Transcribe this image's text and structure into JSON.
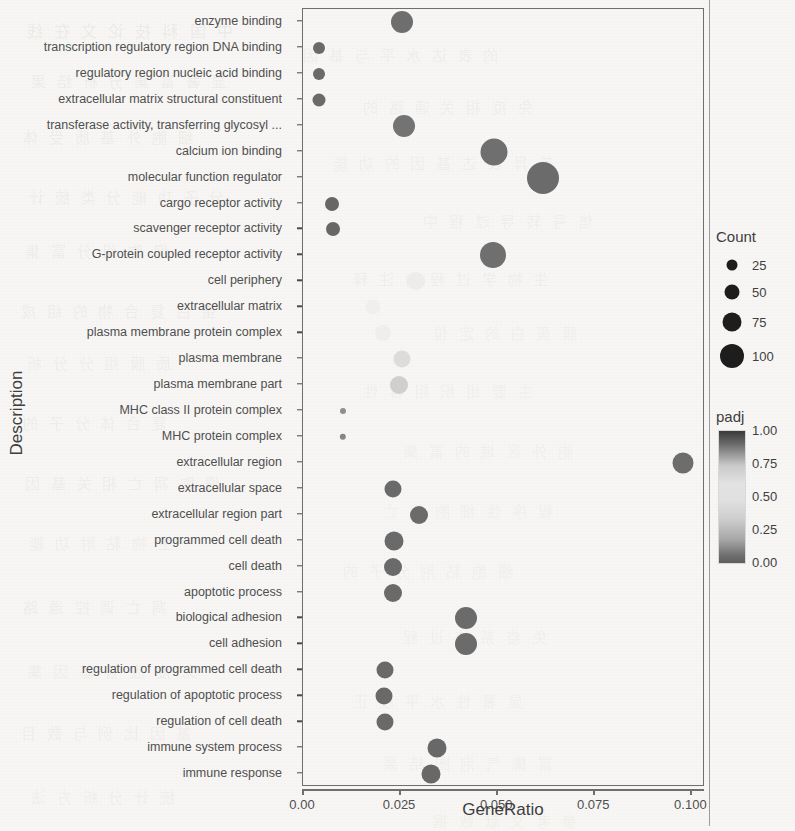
{
  "axes": {
    "y_title": "Description",
    "x_title": "GeneRatio",
    "x_ticks": [
      "0.00",
      "0.025",
      "0.050",
      "0.075",
      "0.100"
    ],
    "x_tick_values": [
      0.0,
      0.025,
      0.05,
      0.075,
      0.1
    ]
  },
  "legend": {
    "count_title": "Count",
    "count_labels": [
      "25",
      "50",
      "75",
      "100"
    ],
    "count_values": [
      25,
      50,
      75,
      100
    ],
    "padj_title": "padj",
    "padj_ticks": [
      "1.00",
      "0.75",
      "0.50",
      "0.25",
      "0.00"
    ],
    "padj_tick_values": [
      1.0,
      0.75,
      0.5,
      0.25,
      0.0
    ],
    "colorbar_low_color": "#5d5d5d",
    "colorbar_mid_color": "#e0e0e0",
    "colorbar_high_color": "#3a3a3a"
  },
  "chart_data": {
    "type": "scatter",
    "title": "",
    "xlabel": "GeneRatio",
    "ylabel": "Description",
    "xlim": [
      0.0,
      0.1035
    ],
    "grid": false,
    "legend_position": "right",
    "size_legend": {
      "name": "Count",
      "breaks": [
        25,
        50,
        75,
        100
      ]
    },
    "color_legend": {
      "name": "padj",
      "breaks": [
        0.0,
        0.25,
        0.5,
        0.75,
        1.0
      ]
    },
    "categories": [
      "enzyme binding",
      "transcription regulatory region DNA binding",
      "regulatory region nucleic acid binding",
      "extracellular matrix structural constituent",
      "transferase activity, transferring glycosyl ...",
      "calcium ion binding",
      "molecular function regulator",
      "cargo receptor activity",
      "scavenger receptor activity",
      "G-protein coupled receptor activity",
      "cell periphery",
      "extracellular matrix",
      "plasma membrane protein complex",
      "plasma membrane",
      "plasma membrane part",
      "MHC class II protein complex",
      "MHC protein complex",
      "extracellular region",
      "extracellular space",
      "extracellular region part",
      "programmed cell death",
      "cell death",
      "apoptotic process",
      "biological adhesion",
      "cell adhesion",
      "regulation of programmed cell death",
      "regulation of apoptotic process",
      "regulation of cell death",
      "immune system process",
      "immune response"
    ],
    "points": [
      {
        "description": "enzyme binding",
        "gene_ratio": 0.0255,
        "count": 62,
        "padj": 0.46,
        "radius": 11.0,
        "color": "#6e6e6e"
      },
      {
        "description": "transcription regulatory region DNA binding",
        "gene_ratio": 0.004,
        "count": 18,
        "padj": 0.3,
        "radius": 6.0,
        "color": "#6a6a6a"
      },
      {
        "description": "regulatory region nucleic acid binding",
        "gene_ratio": 0.004,
        "count": 18,
        "padj": 0.3,
        "radius": 6.0,
        "color": "#6a6a6a"
      },
      {
        "description": "extracellular matrix structural constituent",
        "gene_ratio": 0.004,
        "count": 18,
        "padj": 0.26,
        "radius": 6.5,
        "color": "#6a6a6a"
      },
      {
        "description": "transferase activity, transferring glycosyl ...",
        "gene_ratio": 0.026,
        "count": 62,
        "padj": 0.52,
        "radius": 11.0,
        "color": "#737373"
      },
      {
        "description": "calcium ion binding",
        "gene_ratio": 0.0492,
        "count": 90,
        "padj": 0.6,
        "radius": 13.5,
        "color": "#6f6f6f"
      },
      {
        "description": "molecular function regulator",
        "gene_ratio": 0.0617,
        "count": 105,
        "padj": 0.7,
        "radius": 16.0,
        "color": "#6b6b6b"
      },
      {
        "description": "cargo receptor activity",
        "gene_ratio": 0.0075,
        "count": 22,
        "padj": 0.22,
        "radius": 7.0,
        "color": "#676767"
      },
      {
        "description": "scavenger receptor activity",
        "gene_ratio": 0.0078,
        "count": 22,
        "padj": 0.22,
        "radius": 7.0,
        "color": "#676767"
      },
      {
        "description": "G-protein coupled receptor activity",
        "gene_ratio": 0.049,
        "count": 88,
        "padj": 0.55,
        "radius": 13.0,
        "color": "#6f6f6f"
      },
      {
        "description": "cell periphery",
        "gene_ratio": 0.029,
        "count": 48,
        "padj": 0.97,
        "radius": 9.0,
        "color": "#ececec"
      },
      {
        "description": "extracellular matrix",
        "gene_ratio": 0.018,
        "count": 34,
        "padj": 0.96,
        "radius": 7.5,
        "color": "#efefef"
      },
      {
        "description": "plasma membrane protein complex",
        "gene_ratio": 0.0205,
        "count": 38,
        "padj": 0.95,
        "radius": 8.0,
        "color": "#eeeeee"
      },
      {
        "description": "plasma membrane",
        "gene_ratio": 0.0255,
        "count": 44,
        "padj": 0.9,
        "radius": 8.5,
        "color": "#dcdcdc"
      },
      {
        "description": "plasma membrane part",
        "gene_ratio": 0.0248,
        "count": 44,
        "padj": 0.86,
        "radius": 9.0,
        "color": "#cfcfcf"
      },
      {
        "description": "MHC class II protein complex",
        "gene_ratio": 0.0102,
        "count": 8,
        "padj": 0.18,
        "radius": 3.0,
        "color": "#8e8e8e"
      },
      {
        "description": "MHC protein complex",
        "gene_ratio": 0.0102,
        "count": 9,
        "padj": 0.18,
        "radius": 3.2,
        "color": "#868686"
      },
      {
        "description": "extracellular region",
        "gene_ratio": 0.0978,
        "count": 95,
        "padj": 0.62,
        "radius": 10.5,
        "color": "#6d6d6d"
      },
      {
        "description": "extracellular space",
        "gene_ratio": 0.0232,
        "count": 42,
        "padj": 0.4,
        "radius": 8.5,
        "color": "#6a6a6a"
      },
      {
        "description": "extracellular region part",
        "gene_ratio": 0.0298,
        "count": 50,
        "padj": 0.42,
        "radius": 9.0,
        "color": "#6b6b6b"
      },
      {
        "description": "programmed cell death",
        "gene_ratio": 0.0235,
        "count": 46,
        "padj": 0.35,
        "radius": 9.5,
        "color": "#6a6a6a"
      },
      {
        "description": "cell death",
        "gene_ratio": 0.0232,
        "count": 44,
        "padj": 0.35,
        "radius": 9.0,
        "color": "#6a6a6a"
      },
      {
        "description": "apoptotic process",
        "gene_ratio": 0.0232,
        "count": 44,
        "padj": 0.35,
        "radius": 9.0,
        "color": "#6a6a6a"
      },
      {
        "description": "biological adhesion",
        "gene_ratio": 0.042,
        "count": 68,
        "padj": 0.38,
        "radius": 11.0,
        "color": "#6b6b6b"
      },
      {
        "description": "cell adhesion",
        "gene_ratio": 0.042,
        "count": 68,
        "padj": 0.38,
        "radius": 11.0,
        "color": "#6b6b6b"
      },
      {
        "description": "regulation of programmed cell death",
        "gene_ratio": 0.021,
        "count": 40,
        "padj": 0.3,
        "radius": 8.5,
        "color": "#696969"
      },
      {
        "description": "regulation of apoptotic process",
        "gene_ratio": 0.0208,
        "count": 40,
        "padj": 0.3,
        "radius": 8.5,
        "color": "#696969"
      },
      {
        "description": "regulation of cell death",
        "gene_ratio": 0.021,
        "count": 40,
        "padj": 0.3,
        "radius": 8.5,
        "color": "#696969"
      },
      {
        "description": "immune system process",
        "gene_ratio": 0.0345,
        "count": 56,
        "padj": 0.2,
        "radius": 9.5,
        "color": "#686868"
      },
      {
        "description": "immune response",
        "gene_ratio": 0.033,
        "count": 54,
        "padj": 0.2,
        "radius": 9.5,
        "color": "#686868"
      }
    ]
  },
  "texture_blots": [
    {
      "t": "中 国 科 技 论 文 在 线",
      "x": 24,
      "y": 18,
      "s": 16,
      "o": 0.3
    },
    {
      "t": "的 表 达 水 平 与 基 因",
      "x": 300,
      "y": 44,
      "s": 15,
      "o": 0.22
    },
    {
      "t": "显 著 富 集 分 析 结 果",
      "x": 28,
      "y": 70,
      "s": 15,
      "o": 0.26
    },
    {
      "t": "免 疫 相 关 通 路 的",
      "x": 360,
      "y": 96,
      "s": 15,
      "o": 0.2
    },
    {
      "t": "细 胞 外 基 质 受 体",
      "x": 20,
      "y": 126,
      "s": 15,
      "o": 0.26
    },
    {
      "t": "差 异 表 达 基 因 的 功 能",
      "x": 330,
      "y": 152,
      "s": 15,
      "o": 0.2
    },
    {
      "t": "分 子 功 能 分 类 统 计",
      "x": 26,
      "y": 186,
      "s": 15,
      "o": 0.24
    },
    {
      "t": "信 号 转 导 过 程 中",
      "x": 420,
      "y": 210,
      "s": 15,
      "o": 0.2
    },
    {
      "t": "细 胞 组 分 富 集",
      "x": 22,
      "y": 240,
      "s": 15,
      "o": 0.24
    },
    {
      "t": "生 物 学 过 程 的 注 释",
      "x": 350,
      "y": 268,
      "s": 15,
      "o": 0.2
    },
    {
      "t": "蛋 白 复 合 物 的 组 成",
      "x": 18,
      "y": 300,
      "s": 15,
      "o": 0.24
    },
    {
      "t": "膜 蛋 白 的 定 位",
      "x": 430,
      "y": 322,
      "s": 15,
      "o": 0.18
    },
    {
      "t": "质 膜 组 分 分 析",
      "x": 24,
      "y": 352,
      "s": 15,
      "o": 0.22
    },
    {
      "t": "主 要 组 织 相 容 性",
      "x": 360,
      "y": 380,
      "s": 15,
      "o": 0.18
    },
    {
      "t": "复 合 体 分 子 的",
      "x": 20,
      "y": 412,
      "s": 15,
      "o": 0.22
    },
    {
      "t": "胞 外 区 域 的 富 集",
      "x": 400,
      "y": 440,
      "s": 15,
      "o": 0.18
    },
    {
      "t": "细 胞 凋 亡 相 关 基 因",
      "x": 22,
      "y": 472,
      "s": 15,
      "o": 0.24
    },
    {
      "t": "程 序 性 细 胞 死 亡",
      "x": 380,
      "y": 500,
      "s": 15,
      "o": 0.18
    },
    {
      "t": "生 物 粘 附 功 能",
      "x": 26,
      "y": 532,
      "s": 15,
      "o": 0.22
    },
    {
      "t": "细 胞 粘 附 分 子 的",
      "x": 340,
      "y": 560,
      "s": 15,
      "o": 0.18
    },
    {
      "t": "凋 亡 调 控 通 路",
      "x": 20,
      "y": 596,
      "s": 15,
      "o": 0.24
    },
    {
      "t": "免 疫 系 统 过 程",
      "x": 400,
      "y": 626,
      "s": 15,
      "o": 0.18
    },
    {
      "t": "免 疫 应 答 基 因 集",
      "x": 24,
      "y": 660,
      "s": 15,
      "o": 0.22
    },
    {
      "t": "显 著 性 水 平 校 正",
      "x": 350,
      "y": 690,
      "s": 15,
      "o": 0.18
    },
    {
      "t": "基 因 比 例 与 数 目",
      "x": 18,
      "y": 722,
      "s": 15,
      "o": 0.22
    },
    {
      "t": "富 集 气 泡 图 结 果",
      "x": 380,
      "y": 752,
      "s": 15,
      "o": 0.18
    },
    {
      "t": "统 计 分 析 方 法",
      "x": 28,
      "y": 786,
      "s": 15,
      "o": 0.2
    },
    {
      "t": "参 考 文 献 数 据",
      "x": 430,
      "y": 810,
      "s": 15,
      "o": 0.18
    }
  ]
}
